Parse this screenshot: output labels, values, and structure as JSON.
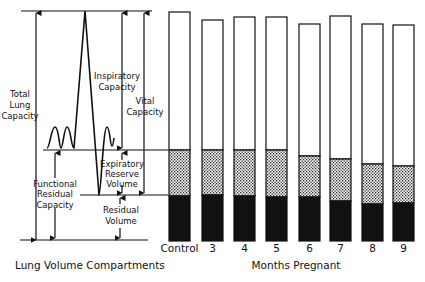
{
  "left_panel": {
    "caption": "Lung Volume Compartments",
    "labels": {
      "total_lung_capacity": [
        "Total",
        "Lung",
        "Capacity"
      ],
      "inspiratory_capacity": [
        "Inspiratory",
        "Capacity"
      ],
      "vital_capacity": [
        "Vital",
        "Capacity"
      ],
      "expiratory_reserve_volume": [
        "Expiratory",
        "Reserve",
        "Volume"
      ],
      "functional_residual_capacity": [
        "Functional",
        "Residual",
        "Capacity"
      ],
      "residual_volume": [
        "Residual",
        "Volume"
      ]
    }
  },
  "chart_data": {
    "type": "bar",
    "stacked": true,
    "title": "",
    "xlabel": "Months Pregnant",
    "ylabel": "",
    "categories": [
      "Control",
      "3",
      "4",
      "5",
      "6",
      "7",
      "8",
      "9"
    ],
    "series": [
      {
        "name": "Residual Volume",
        "fill": "solid-black",
        "values": [
          45,
          46,
          45,
          44,
          44,
          40,
          37,
          38
        ]
      },
      {
        "name": "Expiratory Reserve Volume",
        "fill": "stippled",
        "values": [
          46,
          45,
          46,
          47,
          41,
          42,
          40,
          37
        ]
      },
      {
        "name": "Inspiratory Capacity",
        "fill": "white",
        "values": [
          138,
          130,
          133,
          133,
          132,
          143,
          140,
          141
        ]
      }
    ],
    "units": "relative (pixel-scale estimate)"
  },
  "bars": [
    {
      "label": "Control",
      "x": 169,
      "top": 12,
      "dot": 150,
      "black": 196
    },
    {
      "label": "3",
      "x": 202,
      "top": 20,
      "dot": 150,
      "black": 195
    },
    {
      "label": "4",
      "x": 234,
      "top": 17,
      "dot": 150,
      "black": 196
    },
    {
      "label": "5",
      "x": 266,
      "top": 17,
      "dot": 150,
      "black": 197
    },
    {
      "label": "6",
      "x": 299,
      "top": 24,
      "dot": 156,
      "black": 197
    },
    {
      "label": "7",
      "x": 330,
      "top": 16,
      "dot": 159,
      "black": 201
    },
    {
      "label": "8",
      "x": 362,
      "top": 24,
      "dot": 164,
      "black": 204
    },
    {
      "label": "9",
      "x": 393,
      "top": 25,
      "dot": 166,
      "black": 203
    }
  ]
}
